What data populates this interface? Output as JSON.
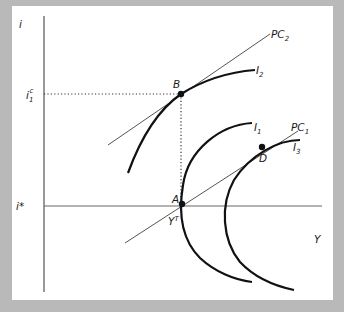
{
  "diagram": {
    "type": "economics-indifference-phillips",
    "axes": {
      "y_label": "i",
      "x_label": "Y"
    },
    "ticks": {
      "i_star": "i*",
      "i1_base": "i",
      "i1_sub": "1",
      "i1_sup": "c",
      "yt_base": "Y",
      "yt_sup": "T"
    },
    "curves": {
      "pc1": {
        "base": "PC",
        "sub": "1"
      },
      "pc2": {
        "base": "PC",
        "sub": "2"
      },
      "i1": {
        "base": "I",
        "sub": "1"
      },
      "i2": {
        "base": "I",
        "sub": "2"
      },
      "i3": {
        "base": "I",
        "sub": "3"
      }
    },
    "points": {
      "A": "A",
      "B": "B",
      "D": "D"
    },
    "colors": {
      "frame": "#b9b9b9",
      "panel": "#ffffff",
      "curve": "#111111",
      "line": "#555555"
    }
  }
}
